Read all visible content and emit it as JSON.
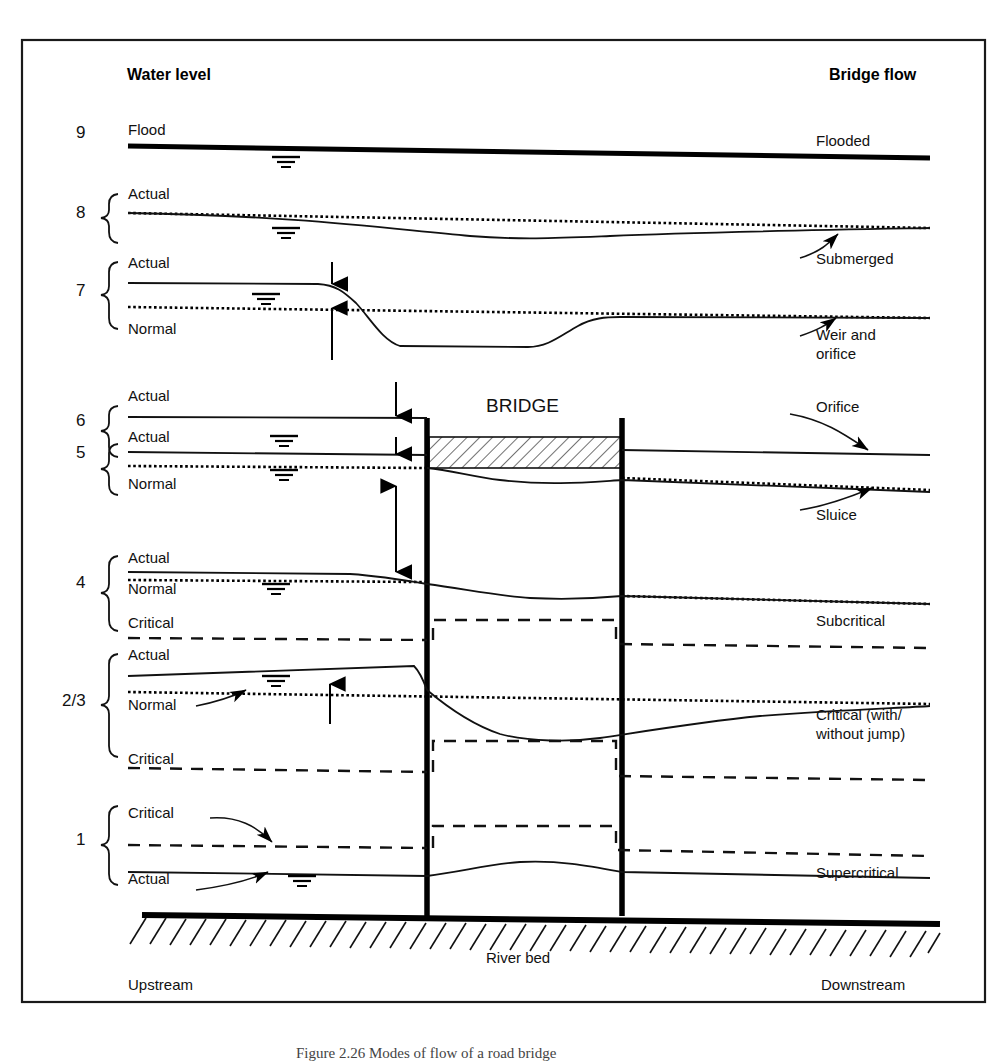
{
  "figure": {
    "caption": "Figure  2.26   Modes of flow of a road bridge",
    "frame_color": "#000000",
    "background": "#ffffff"
  },
  "headers": {
    "left": "Water level",
    "right": "Bridge flow",
    "bridge": "BRIDGE"
  },
  "footer": {
    "upstream": "Upstream",
    "riverbed": "River bed",
    "downstream": "Downstream"
  },
  "levels": [
    {
      "number": "9",
      "water_labels": [
        "Flood"
      ],
      "flow_label": "Flooded",
      "has_brace": false,
      "has_arrow_annotation": false
    },
    {
      "number": "8",
      "water_labels": [
        "Actual"
      ],
      "flow_label": "Submerged",
      "has_brace": true,
      "has_arrow_annotation": true
    },
    {
      "number": "7",
      "water_labels": [
        "Actual",
        "Normal"
      ],
      "flow_label": "Weir and orifice",
      "flow_label_line1": "Weir and",
      "flow_label_line2": "orifice",
      "has_brace": true,
      "has_arrow_annotation": true
    },
    {
      "number": "6",
      "water_labels": [
        "Actual"
      ],
      "flow_label": "Orifice",
      "has_brace": true,
      "has_arrow_annotation": true
    },
    {
      "number": "5",
      "water_labels": [
        "Actual",
        "Normal"
      ],
      "flow_label": "Sluice",
      "has_brace": true,
      "has_arrow_annotation": true
    },
    {
      "number": "4",
      "water_labels": [
        "Actual",
        "Normal",
        "Critical"
      ],
      "flow_label": "Subcritical",
      "has_brace": true,
      "has_arrow_annotation": false
    },
    {
      "number": "2/3",
      "water_labels": [
        "Actual",
        "Normal",
        "Critical"
      ],
      "flow_label": "Critical (with/ without jump)",
      "flow_label_line1": "Critical (with/",
      "flow_label_line2": "without jump)",
      "has_brace": true,
      "has_arrow_annotation": true
    },
    {
      "number": "1",
      "water_labels": [
        "Critical",
        "Actual"
      ],
      "flow_label": "Supercritical",
      "has_brace": true,
      "has_arrow_annotation": true
    }
  ],
  "legend_line_styles": {
    "actual": "solid",
    "normal": "dotted",
    "critical": "dashed",
    "flood": "thick-solid"
  },
  "icons": {
    "water_surface": "water-surface-symbol",
    "pier": "bridge-pier",
    "deck": "bridge-deck-hatched",
    "bed": "river-bed-hatching",
    "brace": "curly-brace",
    "afflux_arrow": "double-headed-arrow"
  }
}
